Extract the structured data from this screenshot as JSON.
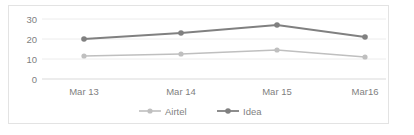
{
  "chart_data": {
    "type": "line",
    "title": "",
    "subtitle": "",
    "xlabel": "",
    "ylabel": "",
    "categories": [
      "Mar 13",
      "Mar 14",
      "Mar 15",
      "Mar16"
    ],
    "series": [
      {
        "name": "Airtel",
        "color": "#bfbfbf",
        "values": [
          11.5,
          12.5,
          14.5,
          11
        ]
      },
      {
        "name": "Idea",
        "color": "#808080",
        "values": [
          20,
          23,
          27,
          21
        ]
      }
    ],
    "ylim": [
      0,
      30
    ],
    "yticks": [
      0,
      10,
      20,
      30
    ],
    "ytick_labels": [
      "0",
      "10",
      "20",
      "30"
    ],
    "grid": true,
    "grid_axis": "y",
    "legend_position": "bottom",
    "marker": "circle",
    "border_color": "#e3e3e3",
    "gridline_color": "#ececec",
    "text_color": "#7f7f7f",
    "background": "#ffffff"
  }
}
